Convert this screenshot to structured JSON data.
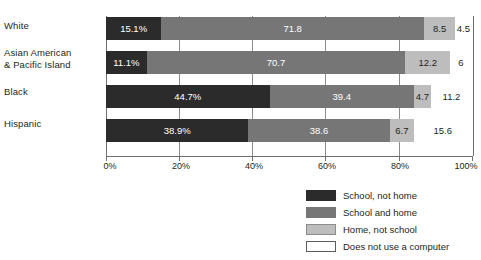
{
  "chart_data": {
    "type": "bar",
    "orientation": "horizontal",
    "stacked": true,
    "stack_mode": "percent",
    "title": "",
    "xlabel": "",
    "ylabel": "",
    "xlim": [
      0,
      100
    ],
    "grid": true,
    "legend_position": "bottom-right",
    "categories": [
      "White",
      "Asian American & Pacific Island",
      "Black",
      "Hispanic"
    ],
    "category_lines": [
      [
        "White"
      ],
      [
        "Asian American",
        "& Pacific Island"
      ],
      [
        "Black"
      ],
      [
        "Hispanic"
      ]
    ],
    "series": [
      {
        "name": "School, not home",
        "color": "#2b2b2b",
        "values": [
          15.1,
          11.1,
          44.7,
          38.9
        ]
      },
      {
        "name": "School and home",
        "color": "#767676",
        "values": [
          71.8,
          70.7,
          39.4,
          38.6
        ]
      },
      {
        "name": "Home, not school",
        "color": "#bdbdbd",
        "values": [
          8.5,
          12.2,
          4.7,
          6.7
        ]
      },
      {
        "name": "Does not use a computer",
        "color": "#ffffff",
        "values": [
          4.5,
          6,
          11.2,
          15.6
        ]
      }
    ],
    "data_labels": [
      [
        "15.1%",
        "71.8",
        "8.5",
        "4.5"
      ],
      [
        "11.1%",
        "70.7",
        "12.2",
        "6"
      ],
      [
        "44.7%",
        "39.4",
        "4.7",
        "11.2"
      ],
      [
        "38.9%",
        "38.6",
        "6.7",
        "15.6"
      ]
    ],
    "xticks": [
      0,
      20,
      40,
      60,
      80,
      100
    ],
    "xticklabels": [
      "0%",
      "20%",
      "40%",
      "60%",
      "80%",
      "100%"
    ]
  },
  "legend": {
    "items": [
      {
        "label": "School, not home"
      },
      {
        "label": "School and home"
      },
      {
        "label": "Home, not school"
      },
      {
        "label": "Does not use a computer"
      }
    ]
  },
  "clipped_heading": ""
}
